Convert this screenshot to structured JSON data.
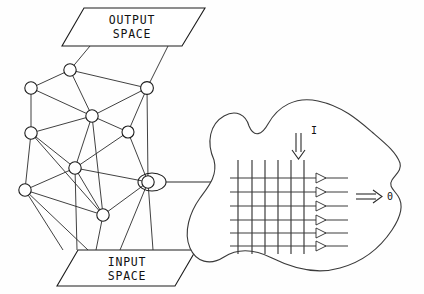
{
  "figure": {
    "background_color": "#fefefe",
    "ink_color": "#1c1c1c"
  },
  "output_panel": {
    "line1": "OUTPUT",
    "line2": "SPACE"
  },
  "input_panel": {
    "line1": "INPUT",
    "line2": "SPACE"
  },
  "receptive_field": {
    "input_label": "I",
    "output_label": "0",
    "grid": {
      "vertical_lines": 6,
      "horizontal_lines": 6,
      "arrow_rows": 6
    }
  },
  "network": {
    "node_count": 11,
    "highlighted_node_index": 10,
    "nodes": [
      {
        "id": "n0",
        "x": 70,
        "y": 70,
        "r": 6.2
      },
      {
        "id": "n1",
        "x": 31,
        "y": 88,
        "r": 6.2
      },
      {
        "id": "n2",
        "x": 147,
        "y": 88,
        "r": 6.4
      },
      {
        "id": "n3",
        "x": 92,
        "y": 116,
        "r": 6.2
      },
      {
        "id": "n4",
        "x": 31,
        "y": 133,
        "r": 6.2
      },
      {
        "id": "n5",
        "x": 128,
        "y": 132,
        "r": 6.0
      },
      {
        "id": "n6",
        "x": 75,
        "y": 168,
        "r": 6.2
      },
      {
        "id": "n7",
        "x": 25,
        "y": 190,
        "r": 6.2
      },
      {
        "id": "n8",
        "x": 103,
        "y": 215,
        "r": 6.2
      },
      {
        "id": "n9",
        "x": 148,
        "y": 182,
        "r": 6.2
      },
      {
        "id": "n10",
        "x": 148,
        "y": 182,
        "r": 6.2
      }
    ]
  }
}
